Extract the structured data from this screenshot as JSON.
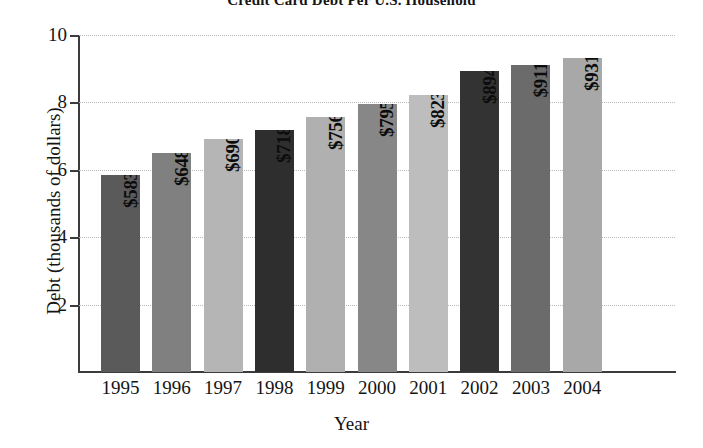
{
  "chart_data": {
    "type": "bar",
    "title": "Credit Card Debt Per U.S. Household",
    "xlabel": "Year",
    "ylabel": "Debt (thousands of dollars)",
    "categories": [
      "1995",
      "1996",
      "1997",
      "1998",
      "1999",
      "2000",
      "2001",
      "2002",
      "2003",
      "2004"
    ],
    "values": [
      5832,
      6487,
      6900,
      7188,
      7564,
      7950,
      8231,
      8940,
      9110,
      9312
    ],
    "value_labels": [
      "$5832",
      "$6487",
      "$6900",
      "$7188",
      "$7564",
      "$7950",
      "$8231",
      "$8940",
      "$9110",
      "$9312"
    ],
    "bar_colors": [
      "#5a5a5a",
      "#808080",
      "#b5b5b5",
      "#2e2e2e",
      "#b0b0b0",
      "#878787",
      "#bdbdbd",
      "#333333",
      "#6b6b6b",
      "#a8a8a8"
    ],
    "units": "thousands of dollars",
    "ylim": [
      0,
      10
    ],
    "ytick_values": [
      2,
      4,
      6,
      8,
      10
    ],
    "ytick_labels": [
      "2",
      "4",
      "6",
      "8",
      "10"
    ],
    "grid": true,
    "grid_style": "dotted-horizontal",
    "legend": "none",
    "value_label_orientation": "vertical-inside-bar"
  }
}
